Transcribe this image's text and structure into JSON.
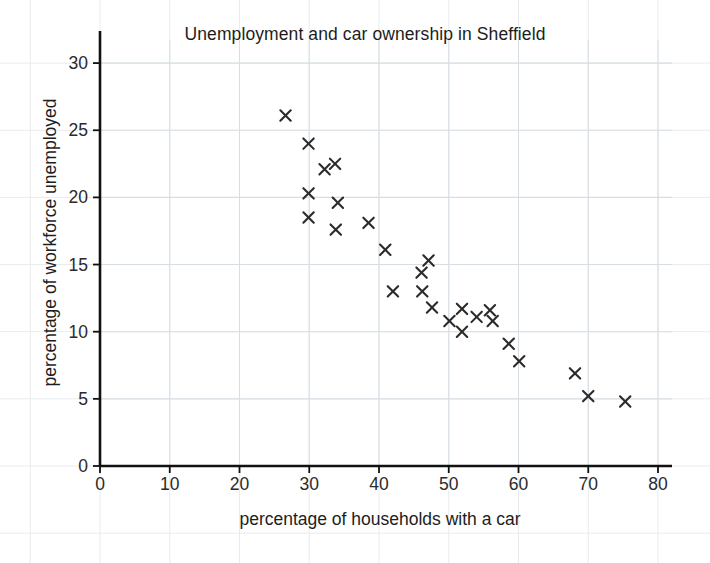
{
  "chart_data": {
    "type": "scatter",
    "title": "Unemployment and car ownership in Sheffield",
    "xlabel": "percentage of households with a car",
    "ylabel": "percentage of workforce unemployed",
    "xlim": [
      0,
      82
    ],
    "ylim": [
      0,
      32
    ],
    "xticks": [
      0,
      10,
      20,
      30,
      40,
      50,
      60,
      70,
      80
    ],
    "yticks": [
      0,
      5,
      10,
      15,
      20,
      25,
      30
    ],
    "grid": true,
    "grid_color": "#d8dfe4",
    "marker": "x",
    "marker_color": "#2b2b2b",
    "legend": null,
    "points": [
      {
        "x": 26.6,
        "y": 26.1
      },
      {
        "x": 29.9,
        "y": 24.0
      },
      {
        "x": 32.2,
        "y": 22.1
      },
      {
        "x": 33.7,
        "y": 22.5
      },
      {
        "x": 29.9,
        "y": 20.3
      },
      {
        "x": 34.1,
        "y": 19.6
      },
      {
        "x": 29.9,
        "y": 18.5
      },
      {
        "x": 33.8,
        "y": 17.6
      },
      {
        "x": 38.5,
        "y": 18.1
      },
      {
        "x": 40.9,
        "y": 16.1
      },
      {
        "x": 42.0,
        "y": 13.0
      },
      {
        "x": 46.1,
        "y": 14.4
      },
      {
        "x": 47.1,
        "y": 15.3
      },
      {
        "x": 46.2,
        "y": 13.0
      },
      {
        "x": 47.6,
        "y": 11.8
      },
      {
        "x": 50.1,
        "y": 10.8
      },
      {
        "x": 51.9,
        "y": 11.7
      },
      {
        "x": 51.9,
        "y": 10.0
      },
      {
        "x": 54.0,
        "y": 11.1
      },
      {
        "x": 55.9,
        "y": 11.6
      },
      {
        "x": 56.3,
        "y": 10.8
      },
      {
        "x": 58.6,
        "y": 9.1
      },
      {
        "x": 60.1,
        "y": 7.8
      },
      {
        "x": 68.1,
        "y": 6.9
      },
      {
        "x": 70.0,
        "y": 5.2
      },
      {
        "x": 75.3,
        "y": 4.8
      }
    ]
  },
  "axis": {
    "x_tick_labels": [
      "0",
      "10",
      "20",
      "30",
      "40",
      "50",
      "60",
      "70",
      "80"
    ],
    "y_tick_labels": [
      "0",
      "5",
      "10",
      "15",
      "20",
      "25",
      "30"
    ],
    "x_title": "percentage of households with a car",
    "y_title": "percentage of workforce unemployed"
  },
  "title": "Unemployment and car ownership in Sheffield",
  "colors": {
    "axis": "#111111",
    "grid": "#d8dfe4",
    "page_grid": "#e7ecef",
    "marker": "#2b2b2b",
    "text": "#1d1d1d",
    "background": "#ffffff"
  }
}
